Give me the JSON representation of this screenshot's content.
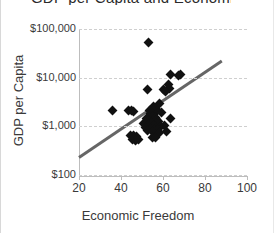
{
  "chart_data": {
    "type": "scatter",
    "title": "GDP per Capita and Economic Freedom",
    "xlabel": "Economic Freedom",
    "ylabel": "GDP per Capita",
    "xlim": [
      20,
      100
    ],
    "ylim": [
      100,
      100000
    ],
    "yscale": "log",
    "xticks": [
      20,
      40,
      60,
      80,
      100
    ],
    "xticklabels": [
      "20",
      "40",
      "60",
      "80",
      "100"
    ],
    "yticks": [
      100,
      1000,
      10000,
      100000
    ],
    "yticklabels": [
      "$100",
      "$1,000",
      "$10,000",
      "$100,000"
    ],
    "grid": "horizontal-dashed",
    "legend": "none",
    "marker": "diamond",
    "marker_color": "#111111",
    "trendline": {
      "color": "#666666",
      "x": [
        20,
        88
      ],
      "y": [
        230,
        22000
      ]
    },
    "points": [
      {
        "x": 53,
        "y": 52000
      },
      {
        "x": 63.5,
        "y": 11500
      },
      {
        "x": 67.5,
        "y": 11000
      },
      {
        "x": 68.5,
        "y": 11500
      },
      {
        "x": 62.5,
        "y": 7200
      },
      {
        "x": 63,
        "y": 6000
      },
      {
        "x": 60,
        "y": 5600
      },
      {
        "x": 61,
        "y": 5200
      },
      {
        "x": 52.5,
        "y": 5600
      },
      {
        "x": 58.5,
        "y": 2900
      },
      {
        "x": 55.5,
        "y": 2600
      },
      {
        "x": 56,
        "y": 2300
      },
      {
        "x": 57.5,
        "y": 2100
      },
      {
        "x": 59.5,
        "y": 1900
      },
      {
        "x": 36,
        "y": 2100
      },
      {
        "x": 43.5,
        "y": 2150
      },
      {
        "x": 45,
        "y": 2100
      },
      {
        "x": 46,
        "y": 2050
      },
      {
        "x": 53.5,
        "y": 2150
      },
      {
        "x": 54,
        "y": 1800
      },
      {
        "x": 55,
        "y": 1600
      },
      {
        "x": 56.5,
        "y": 1500
      },
      {
        "x": 52,
        "y": 1450
      },
      {
        "x": 57,
        "y": 1350
      },
      {
        "x": 58,
        "y": 1250
      },
      {
        "x": 54.5,
        "y": 1200
      },
      {
        "x": 50.5,
        "y": 1150
      },
      {
        "x": 53,
        "y": 1100
      },
      {
        "x": 55.5,
        "y": 1050
      },
      {
        "x": 59,
        "y": 1000
      },
      {
        "x": 60.5,
        "y": 1050
      },
      {
        "x": 63.5,
        "y": 1450
      },
      {
        "x": 51.5,
        "y": 950
      },
      {
        "x": 54,
        "y": 900
      },
      {
        "x": 56,
        "y": 880
      },
      {
        "x": 57.5,
        "y": 850
      },
      {
        "x": 52.5,
        "y": 820
      },
      {
        "x": 55,
        "y": 780
      },
      {
        "x": 58.5,
        "y": 760
      },
      {
        "x": 61.5,
        "y": 800
      },
      {
        "x": 44.5,
        "y": 650
      },
      {
        "x": 46,
        "y": 640
      },
      {
        "x": 47.5,
        "y": 620
      },
      {
        "x": 45.5,
        "y": 540
      },
      {
        "x": 47,
        "y": 520
      },
      {
        "x": 48.5,
        "y": 530
      },
      {
        "x": 55,
        "y": 600
      },
      {
        "x": 56.5,
        "y": 580
      }
    ]
  }
}
